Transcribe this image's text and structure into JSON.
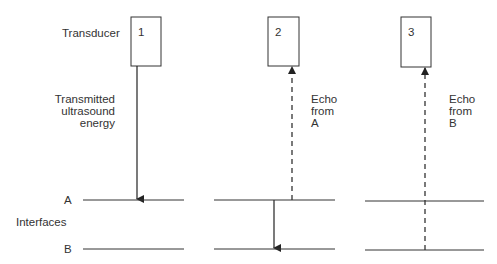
{
  "labels": {
    "transducer": "Transducer",
    "transmitted_line1": "Transmitted",
    "transmitted_line2": "ultrasound",
    "transmitted_line3": "energy",
    "interface_a": "A",
    "interfaces": "Interfaces",
    "interface_b": "B"
  },
  "panels": [
    {
      "number": "1",
      "description": "Transmitted pulse travels down to interface A"
    },
    {
      "number": "2",
      "echo_line1": "Echo",
      "echo_line2": "from",
      "echo_line3": "A"
    },
    {
      "number": "3",
      "echo_line1": "Echo",
      "echo_line2": "from",
      "echo_line3": "B"
    }
  ],
  "colors": {
    "line": "#222222",
    "text": "#333333",
    "background": "#ffffff"
  }
}
